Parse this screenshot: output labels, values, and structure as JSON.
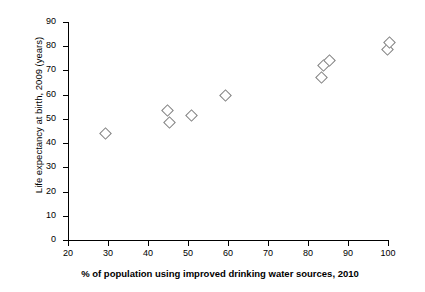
{
  "chart_data": {
    "type": "scatter",
    "title": "",
    "xlabel": "% of population using improved drinking water sources, 2010",
    "ylabel": "Life expectancy at birth, 2009 (years)",
    "xlim": [
      20,
      100
    ],
    "ylim": [
      0,
      90
    ],
    "xticks": [
      20,
      30,
      40,
      50,
      60,
      70,
      80,
      90,
      100
    ],
    "yticks": [
      0,
      10,
      20,
      30,
      40,
      50,
      60,
      70,
      80,
      90
    ],
    "xtick_labels": [
      "20",
      "30",
      "40",
      "50",
      "60",
      "70",
      "80",
      "90",
      "100"
    ],
    "ytick_labels": [
      "0",
      "10",
      "20",
      "30",
      "40",
      "50",
      "60",
      "70",
      "80",
      "90"
    ],
    "grid": false,
    "legend": "none",
    "marker": "open-diamond",
    "marker_color": "#808080",
    "points": [
      {
        "x": 29.0,
        "y": 44.5
      },
      {
        "x": 44.5,
        "y": 54.0
      },
      {
        "x": 45.0,
        "y": 49.0
      },
      {
        "x": 50.5,
        "y": 52.0
      },
      {
        "x": 59.0,
        "y": 60.0
      },
      {
        "x": 83.0,
        "y": 67.5
      },
      {
        "x": 83.5,
        "y": 72.5
      },
      {
        "x": 85.0,
        "y": 74.5
      },
      {
        "x": 99.5,
        "y": 79.0
      },
      {
        "x": 100.0,
        "y": 82.0
      }
    ]
  }
}
